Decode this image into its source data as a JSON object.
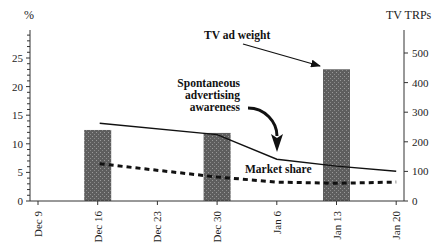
{
  "chart_data": {
    "type": "bar+line",
    "title": "",
    "x": [
      "Dec 9",
      "Dec 16",
      "Dec 23",
      "Dec 30",
      "Jan 6",
      "Jan 13",
      "Jan 20"
    ],
    "left_axis": {
      "label": "%",
      "range": [
        0,
        30
      ],
      "ticks": [
        0,
        5,
        10,
        15,
        20,
        25
      ]
    },
    "right_axis": {
      "label": "TV TRPs",
      "range": [
        0,
        580
      ],
      "ticks": [
        0,
        100,
        200,
        300,
        400,
        500
      ]
    },
    "series": [
      {
        "name": "TV ad weight",
        "type": "bar",
        "axis": "right",
        "x": [
          "Dec 16",
          "Dec 30",
          "Jan 13"
        ],
        "values": [
          240,
          230,
          445
        ],
        "color": "#6a6a6a"
      },
      {
        "name": "Spontaneous advertising awareness",
        "type": "line",
        "style": "solid",
        "axis": "left",
        "x": [
          "Dec 16",
          "Dec 30",
          "Jan 6",
          "Jan 13",
          "Jan 20"
        ],
        "values": [
          13.6,
          11.6,
          7.3,
          6.1,
          5.2
        ],
        "color": "#111111"
      },
      {
        "name": "Market share",
        "type": "line",
        "style": "dashed",
        "axis": "left",
        "x": [
          "Dec 16",
          "Dec 30",
          "Jan 6",
          "Jan 13",
          "Jan 20"
        ],
        "values": [
          6.5,
          4.2,
          3.3,
          3.1,
          3.3
        ],
        "color": "#111111"
      }
    ],
    "annotations": [
      {
        "text": "TV ad weight",
        "points_to": "Jan 13 bar"
      },
      {
        "text": [
          "Spontaneous",
          "advertising",
          "awareness"
        ],
        "points_to": "solid line near Jan 6"
      },
      {
        "text": "Market share",
        "points_to": "dashed line"
      }
    ],
    "grid": false,
    "legend": "inline annotations"
  },
  "labels": {
    "left_axis_unit": "%",
    "right_axis_unit": "TV TRPs",
    "annot_tv": "TV ad weight",
    "annot_aw1": "Spontaneous",
    "annot_aw2": "advertising",
    "annot_aw3": "awareness",
    "annot_ms": "Market share"
  }
}
